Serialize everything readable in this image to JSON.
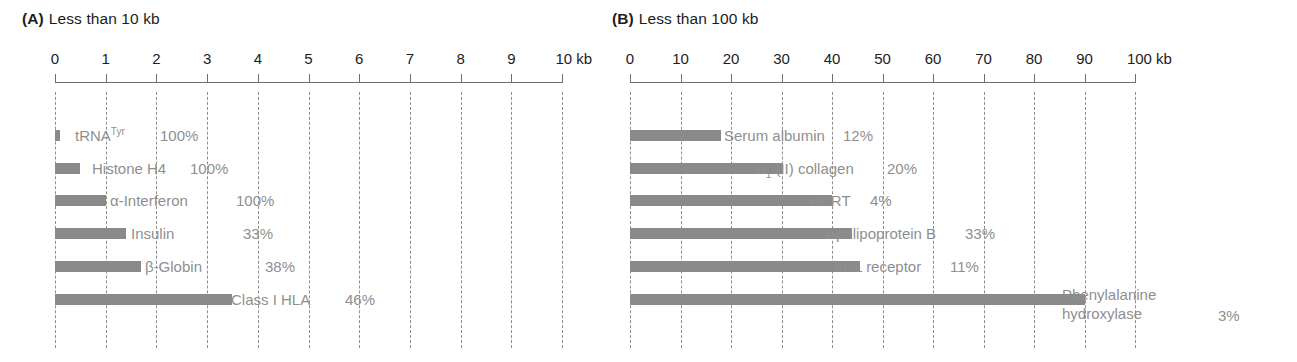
{
  "figure": {
    "background": "#ffffff",
    "bar_color": "#8a8a8a",
    "label_color": "#8f8f8f",
    "axis_color": "#6e6e6e",
    "grid_color": "#8d8d8d"
  },
  "panels": [
    {
      "letter": "(A)",
      "title": "Less than 10 kb",
      "axis_unit": "kb"
    },
    {
      "letter": "(B)",
      "title": "Less than 100 kb",
      "axis_unit": "kb"
    }
  ],
  "chart_data": [
    {
      "type": "bar",
      "orientation": "horizontal",
      "title": "(A) Less than 10 kb",
      "panel_letter": "(A)",
      "panel_title": "Less than 10 kb",
      "xlabel": "kb",
      "ylabel": "",
      "xlim": [
        0,
        10
      ],
      "xticks": [
        0,
        1,
        2,
        3,
        4,
        5,
        6,
        7,
        8,
        9,
        10
      ],
      "xtick_labels": [
        "0",
        "1",
        "2",
        "3",
        "4",
        "5",
        "6",
        "7",
        "8",
        "9",
        "10 kb"
      ],
      "grid": true,
      "grid_axis": "x",
      "legend": "none",
      "categories": [
        "tRNA(Tyr)",
        "Histone H4",
        "α-Interferon",
        "Insulin",
        "β-Globin",
        "Class I HLA"
      ],
      "values": [
        0.1,
        0.5,
        1.0,
        1.4,
        1.7,
        3.5
      ],
      "annotations": [
        "100%",
        "100%",
        "100%",
        "33%",
        "38%",
        "46%"
      ],
      "bars": [
        {
          "label_html": "tRNA<sup>Tyr</sup>",
          "label_text": "tRNA Tyr",
          "value": 0.1,
          "percent": "100%"
        },
        {
          "label_html": "Histone H4",
          "label_text": "Histone H4",
          "value": 0.5,
          "percent": "100%"
        },
        {
          "label_html": "α-Interferon",
          "label_text": "α-Interferon",
          "value": 1.0,
          "percent": "100%"
        },
        {
          "label_html": "Insulin",
          "label_text": "Insulin",
          "value": 1.4,
          "percent": "33%"
        },
        {
          "label_html": "β-Globin",
          "label_text": "β-Globin",
          "value": 1.7,
          "percent": "38%"
        },
        {
          "label_html": "Class I HLA",
          "label_text": "Class I HLA",
          "value": 3.5,
          "percent": "46%"
        }
      ]
    },
    {
      "type": "bar",
      "orientation": "horizontal",
      "title": "(B) Less than 100 kb",
      "panel_letter": "(B)",
      "panel_title": "Less than 100 kb",
      "xlabel": "kb",
      "ylabel": "",
      "xlim": [
        0,
        100
      ],
      "xticks": [
        0,
        10,
        20,
        30,
        40,
        50,
        60,
        70,
        80,
        90,
        100
      ],
      "xtick_labels": [
        "0",
        "10",
        "20",
        "30",
        "40",
        "50",
        "60",
        "70",
        "80",
        "90",
        "100 kb"
      ],
      "grid": true,
      "grid_axis": "x",
      "legend": "none",
      "categories": [
        "Serum albumin",
        "α1 (II) collagen",
        "HPRT",
        "Apolipoprotein B",
        "LDL receptor",
        "Phenylalanine hydroxylase"
      ],
      "values": [
        18,
        30,
        40,
        44,
        45.5,
        90
      ],
      "annotations": [
        "12%",
        "20%",
        "4%",
        "33%",
        "11%",
        "3%"
      ],
      "bars": [
        {
          "label_html": "Serum albumin",
          "label_text": "Serum albumin",
          "value": 18,
          "percent": "12%"
        },
        {
          "label_html": "α<sub>1</sub> (II) collagen",
          "label_text": "α1 (II) collagen",
          "value": 30,
          "percent": "20%"
        },
        {
          "label_html": "HPRT",
          "label_text": "HPRT",
          "value": 40,
          "percent": "4%"
        },
        {
          "label_html": "Apolipoprotein B",
          "label_text": "Apolipoprotein B",
          "value": 44,
          "percent": "33%"
        },
        {
          "label_html": "LDL receptor",
          "label_text": "LDL receptor",
          "value": 45.5,
          "percent": "11%"
        },
        {
          "label_html": "Phenylalanine hydroxylase",
          "label_text": "Phenylalanine hydroxylase",
          "value": 90,
          "percent": "3%",
          "label_line1": "Phenylalanine",
          "label_line2": "hydroxylase"
        }
      ]
    }
  ]
}
